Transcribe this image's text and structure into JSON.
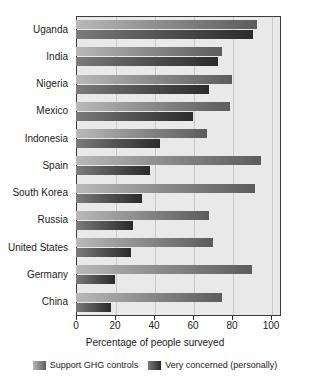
{
  "chart_data": {
    "type": "bar",
    "orientation": "horizontal",
    "title": "",
    "xlabel": "Percentage of people surveyed",
    "ylabel": "",
    "xlim": [
      0,
      100
    ],
    "xticks": [
      0,
      20,
      40,
      60,
      80,
      100
    ],
    "xtick_labels": [
      "0",
      "20",
      "40",
      "60",
      "80",
      "100"
    ],
    "grid": true,
    "grid_axis": "x",
    "legend_position": "bottom",
    "categories": [
      "Uganda",
      "India",
      "Nigeria",
      "Mexico",
      "Indonesia",
      "Spain",
      "South Korea",
      "Russia",
      "United States",
      "Germany",
      "China"
    ],
    "series": [
      {
        "name": "Support GHG controls",
        "color": "#8e8e8e",
        "values": [
          93,
          75,
          80,
          79,
          67,
          95,
          92,
          68,
          70,
          90,
          75
        ]
      },
      {
        "name": "Very concerned (personally)",
        "color": "#3a3a3a",
        "values": [
          91,
          73,
          68,
          60,
          43,
          38,
          34,
          29,
          28,
          20,
          18
        ]
      }
    ]
  },
  "legend": {
    "items": [
      {
        "label": "Support GHG controls",
        "swatch": "support"
      },
      {
        "label": "Very concerned (personally)",
        "swatch": "concerned"
      }
    ]
  }
}
